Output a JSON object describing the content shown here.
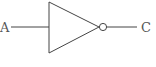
{
  "diagram": {
    "type": "logic-gate",
    "gate": "NOT",
    "input_label": "A",
    "output_label": "C",
    "stroke_color": "#444444"
  }
}
